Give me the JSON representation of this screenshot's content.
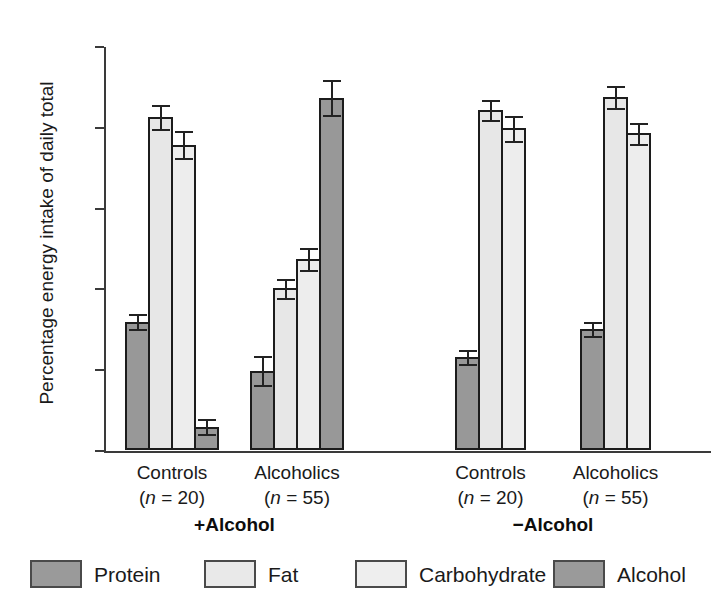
{
  "chart_data": {
    "type": "bar",
    "title": "",
    "xlabel": "",
    "ylabel": "Percentage energy intake of daily total",
    "ylim": [
      0,
      50
    ],
    "yticks": [
      0,
      10,
      20,
      30,
      40,
      50
    ],
    "grid": false,
    "legend_position": "bottom",
    "legend": [
      "Protein",
      "Fat",
      "Carbohydrate",
      "Alcohol"
    ],
    "panels": [
      {
        "label": "+Alcohol",
        "groups": [
          {
            "name": "Controls",
            "n_label": "(n = 20)",
            "n": 20,
            "bars": [
              {
                "series": "Protein",
                "value": 15.9,
                "error": 1.1
              },
              {
                "series": "Fat",
                "value": 41.2,
                "error": 1.6
              },
              {
                "series": "Carbohydrate",
                "value": 37.8,
                "error": 1.8
              },
              {
                "series": "Alcohol",
                "value": 2.9,
                "error": 1.0
              }
            ]
          },
          {
            "name": "Alcoholics",
            "n_label": "(n = 55)",
            "n": 55,
            "bars": [
              {
                "series": "Protein",
                "value": 9.8,
                "error": 1.9
              },
              {
                "series": "Fat",
                "value": 20.0,
                "error": 1.3
              },
              {
                "series": "Carbohydrate",
                "value": 23.6,
                "error": 1.5
              },
              {
                "series": "Alcohol",
                "value": 43.6,
                "error": 2.3
              }
            ]
          }
        ]
      },
      {
        "label": "−Alcohol",
        "groups": [
          {
            "name": "Controls",
            "n_label": "(n = 20)",
            "n": 20,
            "bars": [
              {
                "series": "Protein",
                "value": 11.5,
                "error": 1.0
              },
              {
                "series": "Fat",
                "value": 42.1,
                "error": 1.4
              },
              {
                "series": "Carbohydrate",
                "value": 39.8,
                "error": 1.7
              }
            ]
          },
          {
            "name": "Alcoholics",
            "n_label": "(n = 55)",
            "n": 55,
            "bars": [
              {
                "series": "Protein",
                "value": 15.0,
                "error": 1.0
              },
              {
                "series": "Fat",
                "value": 43.7,
                "error": 1.5
              },
              {
                "series": "Carbohydrate",
                "value": 39.2,
                "error": 1.4
              }
            ]
          }
        ]
      }
    ],
    "colors": {
      "protein": "#989898",
      "fat": "#e7e7e7",
      "carbohydrate": "#ededed",
      "alcohol": "#989898",
      "axis": "#3a3a3a",
      "bar_outline": "#1c1c1c"
    }
  }
}
